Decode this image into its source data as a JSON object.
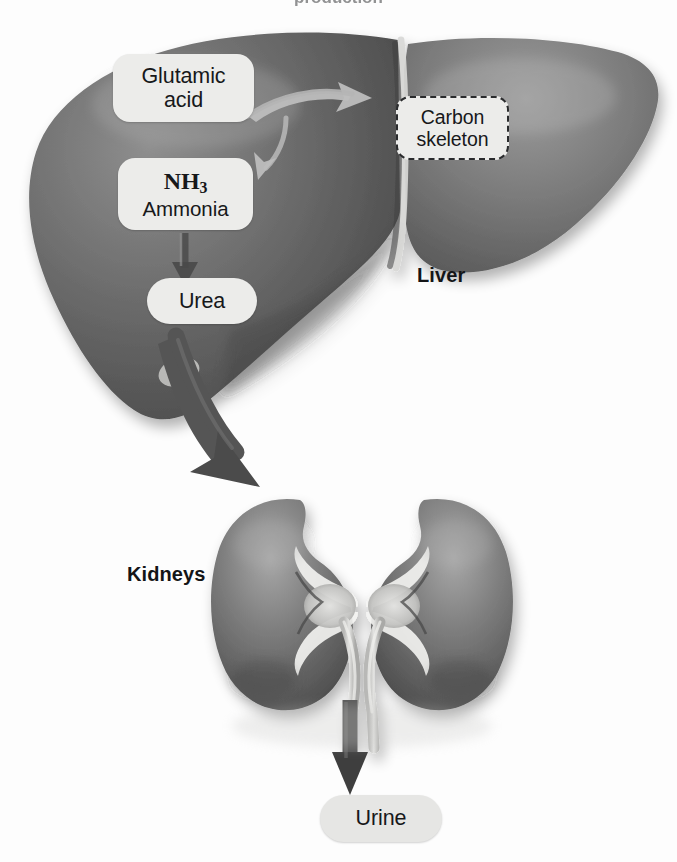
{
  "figure": {
    "title_fragment": "production",
    "background_color": "#fdfdfd"
  },
  "colors": {
    "liver_fill": "#6e6e6e",
    "liver_dark": "#4a4a4a",
    "liver_light": "#8d8d8d",
    "kidney_fill": "#777777",
    "kidney_dark": "#4f4f4f",
    "kidney_light": "#a3a3a3",
    "callout_fill": "#ececea",
    "callout_text": "#17181a",
    "arrow_fill": "#5a5a5a",
    "arrow_dark": "#3b3b3b",
    "ureter_fill": "#d7d7d5"
  },
  "callouts": [
    {
      "id": "glutamic-acid",
      "lines": [
        "Glutamic",
        "acid"
      ],
      "style": "solid",
      "x": 113,
      "y": 54,
      "w": 141,
      "h": 68
    },
    {
      "id": "ammonia",
      "formula": "NH",
      "formula_subscript": "3",
      "lines": [
        "Ammonia"
      ],
      "style": "solid",
      "x": 118,
      "y": 158,
      "w": 135,
      "h": 72
    },
    {
      "id": "urea",
      "lines": [
        "Urea"
      ],
      "style": "solid",
      "x": 147,
      "y": 278,
      "w": 110,
      "h": 46
    },
    {
      "id": "carbon-skeleton",
      "lines": [
        "Carbon",
        "skeleton"
      ],
      "style": "dashed",
      "x": 396,
      "y": 96,
      "w": 113,
      "h": 64
    },
    {
      "id": "urine",
      "lines": [
        "Urine"
      ],
      "style": "solid",
      "x": 320,
      "y": 795,
      "w": 122,
      "h": 47
    }
  ],
  "labels": {
    "glutamic_acid_line1": "Glutamic",
    "glutamic_acid_line2": "acid",
    "ammonia_formula": "NH",
    "ammonia_formula_sub": "3",
    "ammonia_name": "Ammonia",
    "urea": "Urea",
    "carbon_skeleton_line1": "Carbon",
    "carbon_skeleton_line2": "skeleton",
    "urine": "Urine",
    "liver": "Liver",
    "kidneys": "Kidneys"
  },
  "organs": [
    {
      "id": "liver",
      "label": "Liver",
      "label_x": 417,
      "label_y": 264,
      "bounds": {
        "x": 30,
        "y": 30,
        "w": 632,
        "h": 392
      }
    },
    {
      "id": "kidneys",
      "label": "Kidneys",
      "label_x": 127,
      "label_y": 563,
      "bounds": {
        "x": 210,
        "y": 495,
        "w": 305,
        "h": 225
      }
    }
  ],
  "arrows": [
    {
      "id": "glutamic-to-carbon-skeleton",
      "from": "glutamic-acid",
      "to": "carbon-skeleton",
      "shape": "curved",
      "direction": "right-up"
    },
    {
      "id": "glutamic-to-ammonia",
      "from": "glutamic-acid",
      "to": "ammonia",
      "shape": "curved",
      "direction": "down-left"
    },
    {
      "id": "ammonia-to-urea",
      "from": "ammonia",
      "to": "urea",
      "shape": "straight",
      "direction": "down"
    },
    {
      "id": "liver-to-kidneys",
      "from": "urea",
      "to": "kidneys",
      "shape": "curved-thick",
      "direction": "down-right"
    },
    {
      "id": "kidneys-to-urine",
      "from": "kidneys",
      "to": "urine",
      "shape": "straight-thick",
      "direction": "down"
    }
  ]
}
